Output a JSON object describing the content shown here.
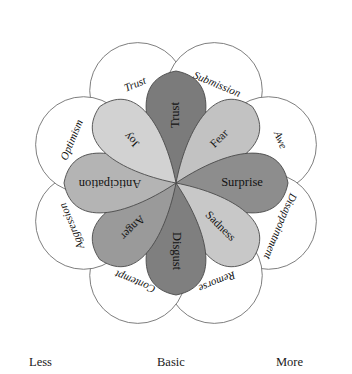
{
  "figure": {
    "center": {
      "x": 176,
      "y": 183
    }
  },
  "chart_data": {
    "type": "pie",
    "xlabel": "",
    "ylabel": "",
    "legend_position": "none",
    "grid": false,
    "categories": [
      "Trust",
      "Fear",
      "Surprise",
      "Sadness",
      "Disgust",
      "Anger",
      "Anticipation",
      "Joy"
    ],
    "values": [
      45,
      45,
      45,
      45,
      45,
      45,
      45,
      45
    ],
    "series": [
      {
        "name": "Basic emotions (inner petals)",
        "values": [
          45,
          45,
          45,
          45,
          45,
          45,
          45,
          45
        ]
      },
      {
        "name": "Dyads (outer circles)",
        "values": [
          45,
          45,
          45,
          45,
          45,
          45,
          45,
          45
        ]
      }
    ]
  },
  "petals": [
    {
      "id": "trust",
      "label": "Trust",
      "angle": -90,
      "length": 112,
      "half_width": 40,
      "fill": "#7b7b7b",
      "label_r": 68,
      "rotate": -90,
      "font_size": 12.5
    },
    {
      "id": "fear",
      "label": "Fear",
      "angle": -45,
      "length": 108,
      "half_width": 40,
      "fill": "#c2c2c2",
      "label_r": 62,
      "rotate": -45,
      "font_size": 11.5
    },
    {
      "id": "surprise",
      "label": "Surprise",
      "angle": 0,
      "length": 112,
      "half_width": 40,
      "fill": "#8d8d8d",
      "label_r": 66,
      "rotate": 0,
      "font_size": 12.5
    },
    {
      "id": "sadness",
      "label": "Sadness",
      "angle": 45,
      "length": 108,
      "half_width": 40,
      "fill": "#c8c8c8",
      "label_r": 62,
      "rotate": 45,
      "font_size": 11.5
    },
    {
      "id": "disgust",
      "label": "Disgust",
      "angle": 90,
      "length": 112,
      "half_width": 40,
      "fill": "#7f7f7f",
      "label_r": 68,
      "rotate": 90,
      "font_size": 12.5
    },
    {
      "id": "anger",
      "label": "Anger",
      "angle": 135,
      "length": 108,
      "half_width": 40,
      "fill": "#9a9a9a",
      "label_r": 62,
      "rotate": 135,
      "font_size": 11.5
    },
    {
      "id": "anticipation",
      "label": "Anticipation",
      "angle": 180,
      "length": 112,
      "half_width": 40,
      "fill": "#b4b4b4",
      "label_r": 66,
      "rotate": 180,
      "font_size": 12.5
    },
    {
      "id": "joy",
      "label": "Joy",
      "angle": -135,
      "length": 108,
      "half_width": 40,
      "fill": "#d2d2d2",
      "label_r": 62,
      "rotate": -135,
      "font_size": 11.5
    }
  ],
  "outer": [
    {
      "id": "trust-outer",
      "label": "Trust",
      "angle": -112.5,
      "cr": 100,
      "radius": 48,
      "label_r": 106,
      "rotate": -112.5,
      "font_size": 11
    },
    {
      "id": "submission",
      "label": "Submission",
      "angle": -67.5,
      "cr": 100,
      "radius": 48,
      "label_r": 106,
      "rotate": -67.5,
      "font_size": 11
    },
    {
      "id": "awe",
      "label": "Awe",
      "angle": -22.5,
      "cr": 100,
      "radius": 48,
      "label_r": 112,
      "rotate": -22.5,
      "font_size": 11
    },
    {
      "id": "disappointment",
      "label": "Disappointment",
      "angle": 22.5,
      "cr": 100,
      "radius": 48,
      "label_r": 112,
      "rotate": 22.5,
      "font_size": 11
    },
    {
      "id": "remorse",
      "label": "Remorse",
      "angle": 67.5,
      "cr": 100,
      "radius": 48,
      "label_r": 106,
      "rotate": 67.5,
      "font_size": 11
    },
    {
      "id": "contempt",
      "label": "Contempt",
      "angle": 112.5,
      "cr": 100,
      "radius": 48,
      "label_r": 106,
      "rotate": 112.5,
      "font_size": 11
    },
    {
      "id": "aggression",
      "label": "Aggression",
      "angle": 157.5,
      "cr": 100,
      "radius": 48,
      "label_r": 112,
      "rotate": 157.5,
      "font_size": 11
    },
    {
      "id": "optimism",
      "label": "Optimism",
      "angle": -157.5,
      "cr": 100,
      "radius": 48,
      "label_r": 112,
      "rotate": -157.5,
      "font_size": 11
    }
  ],
  "axis": {
    "less": "Less",
    "basic": "Basic",
    "more": "More"
  }
}
